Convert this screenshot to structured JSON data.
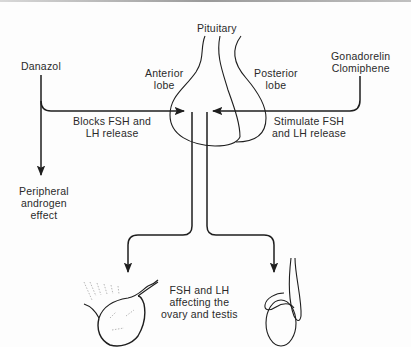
{
  "diagram": {
    "title": "Pituitary",
    "labels": {
      "pituitary": "Pituitary",
      "anterior_lobe_1": "Anterior",
      "anterior_lobe_2": "lobe",
      "posterior_lobe_1": "Posterior",
      "posterior_lobe_2": "lobe",
      "danazol": "Danazol",
      "gonadorelin": "Gonadorelin",
      "clomiphene": "Clomiphene",
      "blocks_1": "Blocks FSH and",
      "blocks_2": "LH release",
      "stimulate_1": "Stimulate FSH",
      "stimulate_2": "and LH release",
      "peripheral_1": "Peripheral",
      "peripheral_2": "androgen",
      "peripheral_3": "effect",
      "target_1": "FSH and LH",
      "target_2": "affecting the",
      "target_3": "ovary and testis"
    },
    "nodes": [
      {
        "id": "pituitary",
        "label": "Pituitary",
        "parts": [
          "Anterior lobe",
          "Posterior lobe"
        ]
      },
      {
        "id": "danazol",
        "label": "Danazol"
      },
      {
        "id": "gonadorelin_clomiphene",
        "label": "Gonadorelin Clomiphene"
      },
      {
        "id": "peripheral",
        "label": "Peripheral androgen effect"
      },
      {
        "id": "ovary",
        "label": "ovary"
      },
      {
        "id": "testis",
        "label": "testis"
      }
    ],
    "edges": [
      {
        "from": "danazol",
        "to": "pituitary",
        "label": "Blocks FSH and LH release"
      },
      {
        "from": "danazol",
        "to": "peripheral",
        "label": ""
      },
      {
        "from": "gonadorelin_clomiphene",
        "to": "pituitary",
        "label": "Stimulate FSH and LH release"
      },
      {
        "from": "pituitary",
        "to": "ovary",
        "label": "FSH and LH affecting the ovary and testis"
      },
      {
        "from": "pituitary",
        "to": "testis",
        "label": "FSH and LH affecting the ovary and testis"
      }
    ],
    "colors": {
      "stroke": "#1e1e1e",
      "text": "#2a2a2a",
      "background": "#fdfdfd"
    }
  }
}
